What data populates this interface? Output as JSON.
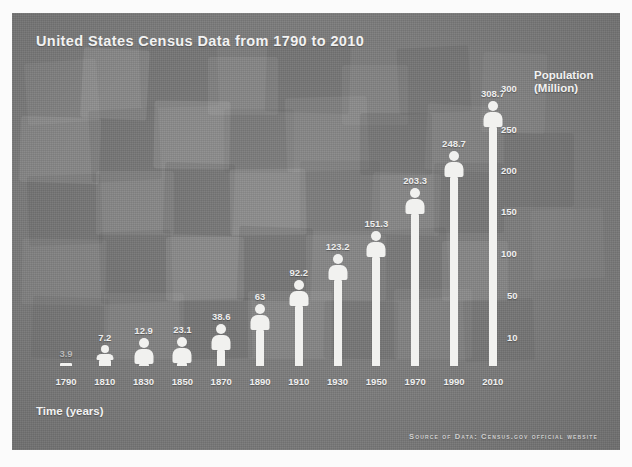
{
  "panel": {
    "background_color": "#7b7b7b",
    "figure_color": "#f1f1ef",
    "text_color": "#f2f2f2"
  },
  "chart_data": {
    "type": "bar",
    "title": "United States Census Data from 1790 to 2010",
    "xlabel": "Time (years)",
    "ylabel": "Population (Million)",
    "categories": [
      "1790",
      "1810",
      "1830",
      "1850",
      "1870",
      "1890",
      "1910",
      "1930",
      "1950",
      "1970",
      "1990",
      "2010"
    ],
    "values": [
      3.9,
      7.2,
      12.9,
      23.1,
      38.6,
      63,
      92.2,
      123.2,
      151.3,
      203.3,
      248.7,
      308.7
    ],
    "value_labels": [
      "3.9",
      "7.2",
      "12.9",
      "23.1",
      "38.6",
      "63",
      "92.2",
      "123.2",
      "151.3",
      "203.3",
      "248.7",
      "308.7"
    ],
    "yticks": [
      10,
      50,
      100,
      150,
      200,
      250,
      300
    ],
    "ytick_labels": [
      "10",
      "50",
      "100",
      "150",
      "200",
      "250",
      "300"
    ],
    "ylim": [
      0,
      320
    ],
    "grid": false,
    "legend": "none",
    "style": "pictogram-bar",
    "units": "Million people"
  },
  "footer": {
    "source": "Source of Data: Census.gov official website"
  }
}
